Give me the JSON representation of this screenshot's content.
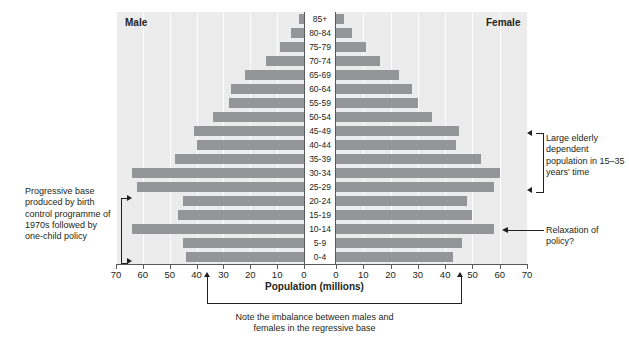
{
  "chart_data": {
    "type": "bar",
    "subtype": "population-pyramid",
    "title": "",
    "xlabel": "Population (millions)",
    "ylabel": "",
    "grid": true,
    "legend_position": "top",
    "xlim_left": [
      0,
      70
    ],
    "xlim_right": [
      0,
      70
    ],
    "xticks_left": [
      70,
      60,
      50,
      40,
      30,
      20,
      10,
      0
    ],
    "xticks_right": [
      0,
      10,
      20,
      30,
      40,
      50,
      60,
      70
    ],
    "categories": [
      "85+",
      "80-84",
      "75-79",
      "70-74",
      "65-69",
      "60-64",
      "55-59",
      "50-54",
      "45-49",
      "40-44",
      "35-39",
      "30-34",
      "25-29",
      "20-24",
      "15-19",
      "10-14",
      "5-9",
      "0-4"
    ],
    "series": [
      {
        "name": "Male",
        "side": "left",
        "values": [
          2,
          5,
          9,
          14,
          22,
          27,
          28,
          34,
          41,
          40,
          48,
          64,
          62,
          45,
          47,
          64,
          45,
          44
        ]
      },
      {
        "name": "Female",
        "side": "right",
        "values": [
          3,
          6,
          11,
          16,
          23,
          28,
          30,
          35,
          45,
          44,
          53,
          60,
          58,
          48,
          50,
          58,
          46,
          43
        ]
      }
    ],
    "annotations": [
      {
        "id": "progressive-base",
        "text": "Progressive base produced by birth control programme of 1970s followed by one-child policy",
        "position": "left"
      },
      {
        "id": "elderly-dependents",
        "text": "Large elderly dependent population in 15-35 years' time",
        "position": "right-upper"
      },
      {
        "id": "relaxation",
        "text": "Relaxation of policy?",
        "position": "right-lower"
      },
      {
        "id": "regressive-base",
        "text": "Note the imbalance between males and females in the regressive base",
        "position": "bottom"
      }
    ],
    "colors": {
      "bar": "#939598",
      "plot_background": "#ececec",
      "gridline": "#ffffff",
      "axis": "#58595b",
      "text": "#231f20"
    }
  },
  "headers": {
    "male": "Male",
    "female": "Female"
  },
  "axis": {
    "title": "Population (millions)"
  },
  "annotations": {
    "left": "Progressive base produced by birth control programme of 1970s followed by one-child policy",
    "elderly": "Large elderly dependent population in 15–35 years' time",
    "relaxation": "Relaxation of policy?",
    "bottom_line1": "Note the imbalance between males and",
    "bottom_line2": "females in the regressive base"
  }
}
